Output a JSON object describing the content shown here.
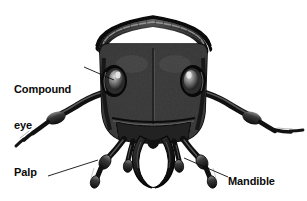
{
  "figure": {
    "type": "anatomical-illustration",
    "background_color": "#ffffff",
    "ink_color": "#0d0d0d",
    "width": 307,
    "height": 201
  },
  "labels": {
    "compound_eye": {
      "line1": "Compound",
      "line2": "eye",
      "full": "Compound eye"
    },
    "palp": {
      "full": "Palp"
    },
    "mandible": {
      "full": "Mandible"
    }
  },
  "leader_lines": [
    {
      "name": "compound-eye-leader",
      "from": [
        84,
        67
      ],
      "to": [
        114,
        80
      ]
    },
    {
      "name": "palp-leader",
      "from": [
        48,
        176
      ],
      "to": [
        96,
        160
      ]
    },
    {
      "name": "mandible-leader",
      "from": [
        184,
        158
      ],
      "to": [
        227,
        177
      ]
    }
  ]
}
